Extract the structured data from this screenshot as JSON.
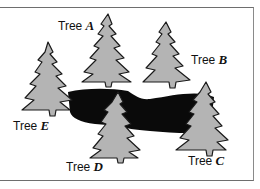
{
  "figure": {
    "colors": {
      "tree_fill": "#b4b4b4",
      "tree_outline": "#1a1a1a",
      "pond": "#0a0a0a",
      "frame": "#6e6e6e"
    },
    "trees": [
      {
        "id": "A",
        "prefix": "Tree ",
        "letter": "A"
      },
      {
        "id": "B",
        "prefix": "Tree ",
        "letter": "B"
      },
      {
        "id": "C",
        "prefix": "Tree ",
        "letter": "C"
      },
      {
        "id": "D",
        "prefix": "Tree ",
        "letter": "D"
      },
      {
        "id": "E",
        "prefix": "Tree ",
        "letter": "E"
      }
    ]
  }
}
